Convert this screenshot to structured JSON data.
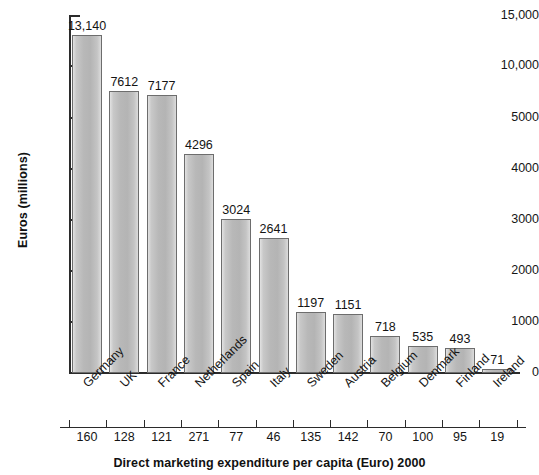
{
  "chart_data": {
    "type": "bar",
    "title": "",
    "xlabel": "Direct marketing expenditure per capita (Euro) 2000",
    "ylabel": "Euros (millions)",
    "categories": [
      "Germany",
      "UK",
      "France",
      "Netherlands",
      "Spain",
      "Italy",
      "Sweden",
      "Austria",
      "Belgium",
      "Denmark",
      "Finland",
      "Ireland"
    ],
    "values": [
      13140,
      7612,
      7177,
      4296,
      3024,
      2641,
      1197,
      1151,
      718,
      535,
      493,
      71
    ],
    "value_labels": [
      "13,140",
      "7612",
      "7177",
      "4296",
      "3024",
      "2641",
      "1197",
      "1151",
      "718",
      "535",
      "493",
      "71"
    ],
    "secondary_axis": {
      "label": "Direct marketing expenditure per capita (Euro) 2000",
      "values": [
        160,
        128,
        121,
        271,
        77,
        46,
        135,
        142,
        70,
        100,
        95,
        19
      ],
      "value_labels": [
        "160",
        "128",
        "121",
        "271",
        "77",
        "46",
        "135",
        "142",
        "70",
        "100",
        "95",
        "19"
      ]
    },
    "yticks": [
      0,
      1000,
      2000,
      3000,
      4000,
      5000,
      10000,
      15000
    ],
    "ytick_labels": [
      "0",
      "1000",
      "2000",
      "3000",
      "4000",
      "5000",
      "10,000",
      "15,000"
    ],
    "ylim": [
      0,
      15000
    ],
    "axis_note": "broken / compressed scale above 5000",
    "grid": false,
    "legend": "none",
    "colors": {
      "bar_fill": "#b8b8b8",
      "bar_edge": "#6d6d6d",
      "axis": "#2b2b2b",
      "text": "#141414",
      "background": "#ffffff"
    }
  }
}
